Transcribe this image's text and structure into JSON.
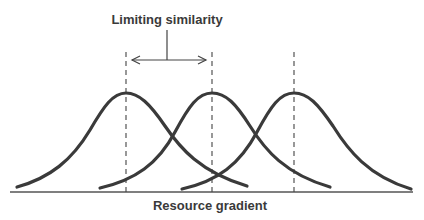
{
  "diagram": {
    "top_label": "Limiting similarity",
    "axis_label": "Resource gradient",
    "colors": {
      "curve": "#3a3a3a",
      "axis": "#555555",
      "dashed": "#444444",
      "text": "#3a3a3a",
      "background": "#ffffff"
    },
    "curves": [
      {
        "name": "species-1",
        "peak_x": 126,
        "left_x": 17,
        "right_x": 247
      },
      {
        "name": "species-2",
        "peak_x": 212,
        "left_x": 100,
        "right_x": 330
      },
      {
        "name": "species-3",
        "peak_x": 294,
        "left_x": 182,
        "right_x": 411
      }
    ],
    "arrow": {
      "from_x": 132,
      "to_x": 206,
      "y": 60
    }
  }
}
